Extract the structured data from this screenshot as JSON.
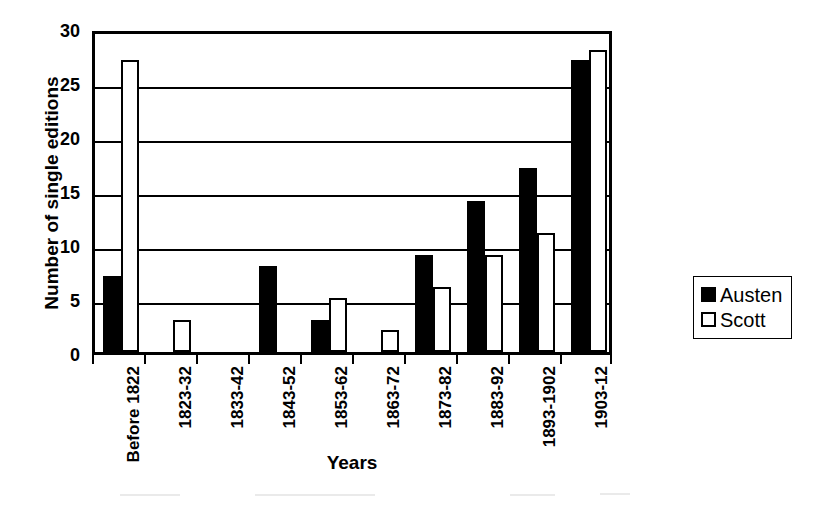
{
  "chart_data": {
    "type": "bar",
    "title": "",
    "xlabel": "Years",
    "ylabel": "Number of single editions",
    "ylim": [
      0,
      30
    ],
    "ytick_step": 5,
    "yticks": [
      0,
      5,
      10,
      15,
      20,
      25,
      30
    ],
    "grid": "horizontal",
    "legend_position": "right",
    "categories": [
      "Before 1822",
      "1823-32",
      "1833-42",
      "1843-52",
      "1853-62",
      "1863-72",
      "1873-82",
      "1883-92",
      "1893-1902",
      "1903-12"
    ],
    "series": [
      {
        "name": "Austen",
        "color": "#000000",
        "style": "filled",
        "values": [
          7,
          0,
          0,
          8,
          3,
          0,
          9,
          14,
          17,
          27
        ]
      },
      {
        "name": "Scott",
        "color": "#ffffff",
        "style": "outlined",
        "values": [
          27,
          3,
          0,
          0,
          5,
          2,
          6,
          9,
          11,
          28
        ]
      }
    ]
  },
  "legend": {
    "entries": [
      {
        "label": "Austen"
      },
      {
        "label": "Scott"
      }
    ]
  },
  "colors": {
    "axis": "#000000",
    "background": "#ffffff",
    "series_austen": "#000000",
    "series_scott": "#ffffff"
  }
}
